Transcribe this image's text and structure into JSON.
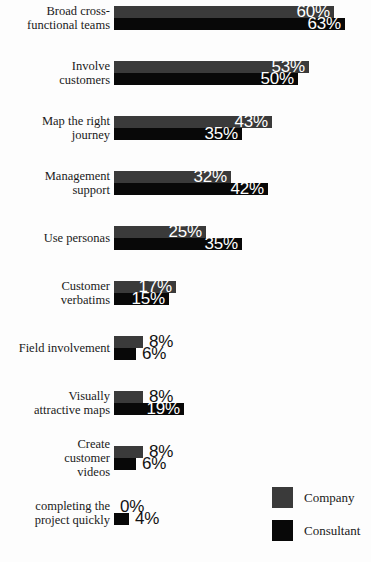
{
  "chart_data": {
    "type": "bar",
    "orientation": "horizontal",
    "title": "",
    "xlabel": "",
    "ylabel": "",
    "grid": false,
    "xlim": [
      0,
      65
    ],
    "legend_position": "bottom-right",
    "value_suffix": "%",
    "categories": [
      "Broad cross-\nfunctional teams",
      "Involve\ncustomers",
      "Map the right\njourney",
      "Management\nsupport",
      "Use personas",
      "Customer\nverbatims",
      "Field involvement",
      "Visually\nattractive maps",
      "Create\ncustomer\nvideos",
      "completing the\nproject quickly"
    ],
    "series": [
      {
        "name": "Company",
        "color": "#3a3a3a",
        "values": [
          60,
          53,
          43,
          32,
          25,
          17,
          8,
          8,
          8,
          0
        ]
      },
      {
        "name": "Consultant",
        "color": "#080808",
        "values": [
          63,
          50,
          35,
          42,
          35,
          15,
          6,
          19,
          6,
          4
        ]
      }
    ]
  },
  "rows": [
    {
      "label_lines": [
        "Broad cross-",
        "functional teams"
      ],
      "company": {
        "value": "60%",
        "num": 60,
        "inside": true
      },
      "consultant": {
        "value": "63%",
        "num": 63,
        "inside": true
      }
    },
    {
      "label_lines": [
        "Involve",
        "customers"
      ],
      "company": {
        "value": "53%",
        "num": 53,
        "inside": true
      },
      "consultant": {
        "value": "50%",
        "num": 50,
        "inside": true
      }
    },
    {
      "label_lines": [
        "Map the right",
        "journey"
      ],
      "company": {
        "value": "43%",
        "num": 43,
        "inside": true
      },
      "consultant": {
        "value": "35%",
        "num": 35,
        "inside": true
      }
    },
    {
      "label_lines": [
        "Management",
        "support"
      ],
      "company": {
        "value": "32%",
        "num": 32,
        "inside": true
      },
      "consultant": {
        "value": "42%",
        "num": 42,
        "inside": true
      }
    },
    {
      "label_lines": [
        "Use personas"
      ],
      "company": {
        "value": "25%",
        "num": 25,
        "inside": true
      },
      "consultant": {
        "value": "35%",
        "num": 35,
        "inside": true
      }
    },
    {
      "label_lines": [
        "Customer",
        "verbatims"
      ],
      "company": {
        "value": "17%",
        "num": 17,
        "inside": true
      },
      "consultant": {
        "value": "15%",
        "num": 15,
        "inside": true
      }
    },
    {
      "label_lines": [
        "Field involvement"
      ],
      "company": {
        "value": "8%",
        "num": 8,
        "inside": false
      },
      "consultant": {
        "value": "6%",
        "num": 6,
        "inside": false
      }
    },
    {
      "label_lines": [
        "Visually",
        "attractive maps"
      ],
      "company": {
        "value": "8%",
        "num": 8,
        "inside": false
      },
      "consultant": {
        "value": "19%",
        "num": 19,
        "inside": true
      }
    },
    {
      "label_lines": [
        "Create",
        "customer",
        "videos"
      ],
      "company": {
        "value": "8%",
        "num": 8,
        "inside": false
      },
      "consultant": {
        "value": "6%",
        "num": 6,
        "inside": false
      }
    },
    {
      "label_lines": [
        "completing the",
        "project quickly"
      ],
      "company": {
        "value": "0%",
        "num": 0,
        "inside": false
      },
      "consultant": {
        "value": "4%",
        "num": 4,
        "inside": false
      }
    }
  ],
  "legend": {
    "items": [
      {
        "label": "Company",
        "color": "#3a3a3a"
      },
      {
        "label": "Consultant",
        "color": "#080808"
      }
    ]
  }
}
